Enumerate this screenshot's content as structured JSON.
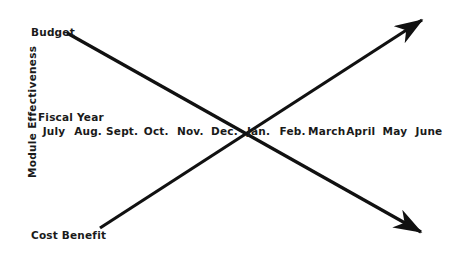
{
  "figure": {
    "background_color": "#ffffff",
    "ink_color": "#111111",
    "y_axis_label": "Module Effectiveness",
    "x_axis_group_label": "Fiscal Year"
  },
  "chart_data": {
    "type": "line",
    "title": "",
    "subtitle": "",
    "xlabel": "Fiscal Year",
    "ylabel": "Module Effectiveness",
    "grid": false,
    "legend_position": "inline-endpoint-labels",
    "categories": [
      "July",
      "Aug.",
      "Sept.",
      "Oct.",
      "Nov.",
      "Dec.",
      "Jan.",
      "Feb.",
      "March",
      "April",
      "May",
      "June"
    ],
    "x": [
      0,
      1,
      2,
      3,
      4,
      5,
      6,
      7,
      8,
      9,
      10,
      11
    ],
    "xlim": [
      0,
      11
    ],
    "ylim": [
      0,
      100
    ],
    "annotations": [
      {
        "text": "Budget",
        "x": 0.6,
        "y": 88
      },
      {
        "text": "Cost Benefit",
        "x": 0.6,
        "y": 10
      },
      {
        "text": "Fiscal Year",
        "x": 0.2,
        "y": 52
      }
    ],
    "series": [
      {
        "name": "Budget",
        "label_position": "left-top",
        "arrow": "end",
        "direction": "descending",
        "values": [
          88,
          80,
          72,
          64,
          57,
          49,
          42,
          34,
          26,
          19,
          11,
          3
        ],
        "points": [
          {
            "x": 0.6,
            "y": 88
          },
          {
            "x": 11.6,
            "y": 1
          }
        ]
      },
      {
        "name": "Cost Benefit",
        "label_position": "left-bottom",
        "arrow": "end",
        "direction": "ascending",
        "values": [
          10,
          18,
          26,
          34,
          41,
          49,
          57,
          65,
          72,
          80,
          88,
          96
        ],
        "points": [
          {
            "x": 1.55,
            "y": 10
          },
          {
            "x": 11.8,
            "y": 98
          }
        ]
      }
    ],
    "crossing_point": {
      "category": "Jan.",
      "x": 6,
      "y": 50
    }
  },
  "geometry": {
    "budget_line": {
      "x1": 67,
      "y1": 33,
      "x2": 428,
      "y2": 14,
      "note": "drawn descending left-to-right"
    },
    "cost_line": {
      "x1": 100,
      "y1": 228,
      "x2": 430,
      "y2": 238
    }
  }
}
